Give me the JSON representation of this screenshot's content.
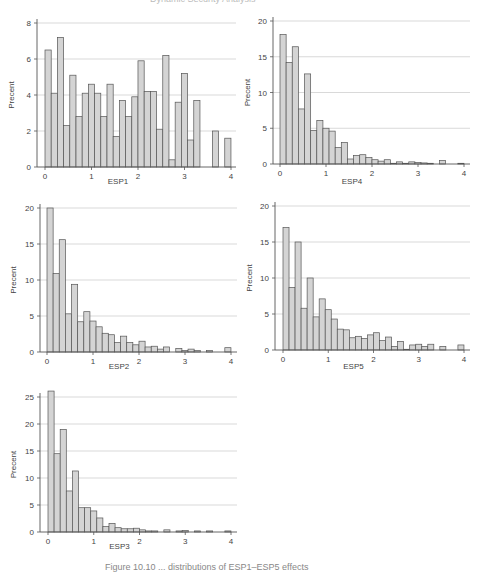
{
  "header": {
    "running_text": "Dynamic Security Analysis"
  },
  "caption": {
    "text": "Figure 10.10 ... distributions of ESP1–ESP5 effects"
  },
  "style": {
    "bar_fill": "#d4d4d4",
    "bar_stroke": "#555555",
    "grid": "#cfcfcf",
    "axis": "#555555",
    "text": "#444444"
  },
  "chart_data": [
    {
      "id": "esp1",
      "type": "bar",
      "title": "",
      "xlabel": "ESP1",
      "ylabel": "Precent",
      "bin_width": 0.1333,
      "xlim": [
        0,
        4
      ],
      "ylim": [
        0,
        8
      ],
      "yticks": [
        0,
        2,
        4,
        6,
        8
      ],
      "xticks": [
        0,
        1,
        2,
        3,
        4
      ],
      "grid": true,
      "values": [
        6.5,
        4.1,
        7.2,
        2.3,
        5.1,
        2.8,
        4.1,
        4.6,
        4.1,
        2.8,
        4.6,
        1.7,
        3.7,
        2.8,
        3.9,
        5.9,
        4.2,
        4.2,
        2.1,
        6.2,
        0.4,
        3.6,
        5.2,
        1.5,
        3.7,
        0,
        0,
        2.0,
        0,
        1.6
      ]
    },
    {
      "id": "esp4",
      "type": "bar",
      "title": "",
      "xlabel": "ESP4",
      "ylabel": "Precent",
      "bin_width": 0.1333,
      "xlim": [
        0,
        4
      ],
      "ylim": [
        0,
        20
      ],
      "yticks": [
        0,
        5,
        10,
        15,
        20
      ],
      "xticks": [
        0,
        1,
        2,
        3,
        4
      ],
      "grid": true,
      "values": [
        18.1,
        14.2,
        16.4,
        7.7,
        12.6,
        4.7,
        6.1,
        5.0,
        4.6,
        2.3,
        3.0,
        0.7,
        1.2,
        1.3,
        0.9,
        0.6,
        0.4,
        0.6,
        0.1,
        0.3,
        0.1,
        0.3,
        0.2,
        0.15,
        0.1,
        0,
        0.5,
        0,
        0,
        0.1
      ]
    },
    {
      "id": "esp2",
      "type": "bar",
      "title": "",
      "xlabel": "ESP2",
      "ylabel": "Precent",
      "bin_width": 0.1333,
      "xlim": [
        0,
        4
      ],
      "ylim": [
        0,
        20
      ],
      "yticks": [
        0,
        5,
        10,
        15,
        20
      ],
      "xticks": [
        0,
        1,
        2,
        3,
        4
      ],
      "grid": true,
      "values": [
        20.0,
        10.9,
        15.6,
        5.3,
        9.4,
        4.2,
        5.6,
        4.3,
        3.5,
        2.6,
        2.4,
        1.3,
        2.2,
        1.3,
        1.0,
        1.5,
        0.7,
        0.8,
        0.4,
        0.7,
        0,
        0.5,
        0.2,
        0.4,
        0.2,
        0,
        0.2,
        0,
        0,
        0.6
      ]
    },
    {
      "id": "esp5",
      "type": "bar",
      "title": "",
      "xlabel": "ESP5",
      "ylabel": "Precent",
      "bin_width": 0.1333,
      "xlim": [
        0,
        4
      ],
      "ylim": [
        0,
        20
      ],
      "yticks": [
        0,
        5,
        10,
        15,
        20
      ],
      "xticks": [
        0,
        1,
        2,
        3,
        4
      ],
      "grid": true,
      "values": [
        17.0,
        8.7,
        15.0,
        5.8,
        10.0,
        4.6,
        7.1,
        5.6,
        4.3,
        2.9,
        2.8,
        1.7,
        1.9,
        1.6,
        2.1,
        2.4,
        1.3,
        1.8,
        0.5,
        1.2,
        0.1,
        0.7,
        0.8,
        0.5,
        0.8,
        0,
        0.5,
        0,
        0,
        0.7
      ]
    },
    {
      "id": "esp3",
      "type": "bar",
      "title": "",
      "xlabel": "ESP3",
      "ylabel": "Precent",
      "bin_width": 0.1333,
      "xlim": [
        0,
        4
      ],
      "ylim": [
        0,
        25
      ],
      "yticks": [
        0,
        5,
        10,
        15,
        20,
        25
      ],
      "xticks": [
        0,
        1,
        2,
        3,
        4
      ],
      "grid": true,
      "values": [
        26.1,
        14.5,
        19.0,
        7.6,
        11.3,
        4.5,
        4.5,
        3.9,
        2.6,
        1.0,
        1.6,
        0.8,
        0.6,
        0.6,
        0.7,
        0.4,
        0.2,
        0.2,
        0,
        0.4,
        0,
        0.2,
        0.3,
        0,
        0.2,
        0,
        0.2,
        0,
        0,
        0.2
      ]
    }
  ]
}
